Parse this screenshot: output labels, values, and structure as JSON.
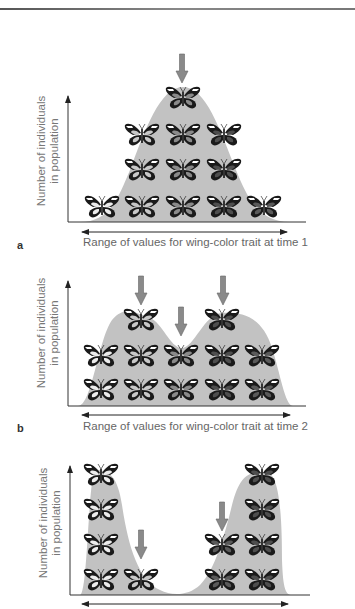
{
  "figure": {
    "colors": {
      "curve_fill": "#c2c2c2",
      "arrow_fill": "#8a8a8a",
      "axis": "#333333",
      "butterfly_outline": "#1a1a1a",
      "butterfly_light": "#ececec",
      "butterfly_mid": "#8a8a8a",
      "butterfly_dark": "#4a4a4a"
    },
    "panels": [
      {
        "id": "a",
        "label": "a",
        "y_axis_label_line1": "Number of individuals",
        "y_axis_label_line2": "in population",
        "x_axis_label": "Range of values for wing-color trait at time 1",
        "distribution": "unimodal",
        "selection_arrows": 1
      },
      {
        "id": "b",
        "label": "b",
        "y_axis_label_line1": "Number of individuals",
        "y_axis_label_line2": "in population",
        "x_axis_label": "Range of values for wing-color trait at time 2",
        "distribution": "bimodal",
        "selection_arrows": 3
      },
      {
        "id": "c",
        "label": "",
        "y_axis_label_line1": "Number of individuals",
        "y_axis_label_line2": "in population",
        "x_axis_label": "",
        "distribution": "disruptive (two separated peaks)",
        "selection_arrows": 2
      }
    ]
  }
}
